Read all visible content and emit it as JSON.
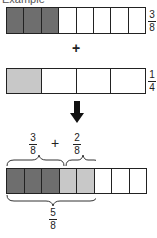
{
  "title": "Example",
  "colors": {
    "shaded_dark": "#6e6e6e",
    "shaded_light": "#c8c8c8",
    "border": "#222222"
  },
  "bar1": {
    "cells": 8,
    "shaded": 3,
    "fraction": {
      "num": "3",
      "den": "8"
    }
  },
  "operator": "+",
  "bar2": {
    "cells": 4,
    "shaded": 1,
    "fraction": {
      "num": "1",
      "den": "4"
    }
  },
  "arrow": "down-arrow",
  "result": {
    "left_fraction": {
      "num": "3",
      "den": "8"
    },
    "operator": "+",
    "right_fraction": {
      "num": "2",
      "den": "8"
    },
    "bar": {
      "cells": 8,
      "dark": 3,
      "light": 2
    },
    "total_fraction": {
      "num": "5",
      "den": "8"
    }
  }
}
